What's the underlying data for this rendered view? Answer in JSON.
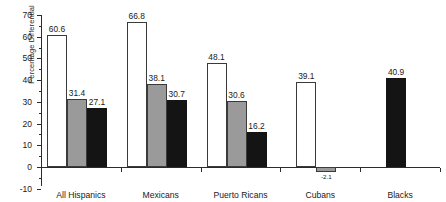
{
  "chart_data": {
    "type": "bar",
    "title": "",
    "xlabel": "",
    "ylabel": "Percentage Differential",
    "ylim": [
      -10,
      70
    ],
    "ytick_step": 10,
    "grid": false,
    "legend": "none",
    "categories": [
      "All Hispanics",
      "Mexicans",
      "Puerto Ricans",
      "Cubans",
      "Blacks"
    ],
    "ytick_labels": [
      "70",
      "60",
      "50",
      "40",
      "30",
      "20",
      "10",
      "0",
      "-10"
    ],
    "ytick_values": [
      70,
      60,
      50,
      40,
      30,
      20,
      10,
      0,
      -10
    ],
    "series": [
      {
        "name": "series-1",
        "color": "#ffffff",
        "values": [
          60.6,
          66.8,
          48.1,
          39.1,
          null
        ],
        "labels": [
          "60.6",
          "66.8",
          "48.1",
          "39.1",
          ""
        ]
      },
      {
        "name": "series-2",
        "color": "#9a9a9a",
        "values": [
          31.4,
          38.1,
          30.6,
          -2.1,
          null
        ],
        "labels": [
          "31.4",
          "38.1",
          "30.6",
          "-2.1",
          ""
        ]
      },
      {
        "name": "series-3",
        "color": "#141414",
        "values": [
          27.1,
          30.7,
          16.2,
          null,
          40.9
        ],
        "labels": [
          "27.1",
          "30.7",
          "16.2",
          "",
          "40.9"
        ]
      }
    ]
  },
  "axis": {
    "y_title": "Percentage Differential"
  }
}
